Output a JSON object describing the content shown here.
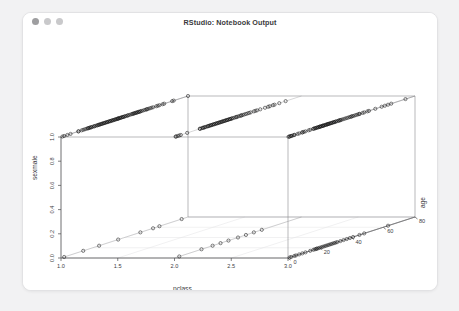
{
  "window": {
    "title": "RStudio: Notebook Output",
    "dots": [
      "close-dot",
      "minimize-dot",
      "zoom-dot"
    ]
  },
  "chart_data": {
    "type": "scatter",
    "projection": "3d",
    "title": "",
    "xlabel": "pclass",
    "ylabel": "sexmale",
    "zlabel": "age",
    "xticks": [
      "1.0",
      "1.5",
      "2.0",
      "2.5",
      "3.0"
    ],
    "xtickvals": [
      1.0,
      1.5,
      2.0,
      2.5,
      3.0
    ],
    "yticks": [
      "0.0",
      "0.2",
      "0.4",
      "0.6",
      "0.8",
      "1.0"
    ],
    "ytickvals": [
      0.0,
      0.2,
      0.4,
      0.6,
      0.8,
      1.0
    ],
    "zticks": [
      "0",
      "20",
      "40",
      "60",
      "80"
    ],
    "ztickvals": [
      0,
      20,
      40,
      60,
      80
    ],
    "xlim": [
      1.0,
      3.0
    ],
    "ylim": [
      0.0,
      1.0
    ],
    "zlim": [
      0,
      80
    ],
    "grid": true,
    "legend": "none",
    "point_marker": "open-circle",
    "point_color": "#1a1a1a",
    "series": [
      {
        "name": "pclass=1, sexmale=1",
        "pclass": 1,
        "sexmale": 1,
        "ages": [
          0.9,
          2,
          4,
          6,
          11,
          11,
          13,
          14,
          15,
          16,
          17,
          17,
          18,
          18,
          19,
          19,
          20,
          21,
          21,
          22,
          23,
          23,
          24,
          24,
          25,
          25,
          26,
          26,
          27,
          27,
          28,
          28,
          29,
          29,
          30,
          30,
          31,
          31,
          32,
          32,
          33,
          33,
          34,
          34,
          35,
          35,
          36,
          36,
          36,
          37,
          37,
          38,
          38,
          39,
          39,
          40,
          40,
          41,
          42,
          42,
          43,
          44,
          45,
          45,
          46,
          46,
          47,
          47,
          48,
          48,
          49,
          49,
          50,
          50,
          51,
          52,
          53,
          54,
          54,
          55,
          56,
          57,
          58,
          60,
          61,
          62,
          64,
          65,
          70,
          71,
          80
        ]
      },
      {
        "name": "pclass=2, sexmale=1",
        "pclass": 2,
        "sexmale": 1,
        "ages": [
          0.7,
          1,
          2,
          3,
          4,
          8,
          16,
          16,
          17,
          18,
          18,
          19,
          19,
          20,
          21,
          21,
          22,
          22,
          23,
          23,
          24,
          24,
          25,
          25,
          26,
          26,
          27,
          27,
          28,
          28,
          29,
          29,
          30,
          30,
          31,
          31,
          32,
          32,
          33,
          33,
          34,
          34,
          35,
          35,
          36,
          36,
          37,
          38,
          39,
          39,
          40,
          41,
          42,
          42,
          43,
          44,
          45,
          46,
          47,
          48,
          50,
          51,
          52,
          54,
          57,
          59,
          60,
          62,
          63,
          66,
          70
        ]
      },
      {
        "name": "pclass=3, sexmale=1",
        "pclass": 3,
        "sexmale": 1,
        "ages": [
          0.3,
          1,
          1,
          2,
          2,
          3,
          4,
          4,
          6,
          7,
          9,
          9,
          10,
          11,
          13,
          14,
          16,
          16,
          17,
          17,
          18,
          18,
          19,
          19,
          20,
          20,
          20,
          21,
          21,
          22,
          22,
          22,
          23,
          23,
          24,
          24,
          25,
          25,
          25,
          26,
          26,
          27,
          27,
          28,
          28,
          29,
          29,
          30,
          30,
          31,
          32,
          32,
          33,
          33,
          34,
          35,
          36,
          37,
          38,
          39,
          40,
          40,
          41,
          42,
          43,
          44,
          45,
          45,
          47,
          48,
          50,
          51,
          55,
          59,
          61,
          63,
          65,
          74
        ]
      },
      {
        "name": "pclass=1, sexmale=0",
        "pclass": 1,
        "sexmale": 0,
        "ages": [
          2,
          14,
          24,
          36,
          50,
          58,
          62,
          76
        ]
      },
      {
        "name": "pclass=2, sexmale=0",
        "pclass": 2,
        "sexmale": 0,
        "ages": [
          3,
          17,
          24,
          29,
          34,
          40,
          45,
          50,
          55
        ]
      },
      {
        "name": "pclass=3, sexmale=0",
        "pclass": 3,
        "sexmale": 0,
        "ages": [
          1,
          2,
          4,
          5,
          7,
          9,
          11,
          14,
          16,
          17,
          18,
          18,
          19,
          20,
          21,
          22,
          23,
          24,
          25,
          26,
          27,
          28,
          29,
          30,
          31,
          33,
          35,
          37,
          39,
          41,
          45,
          48,
          63
        ]
      }
    ]
  }
}
